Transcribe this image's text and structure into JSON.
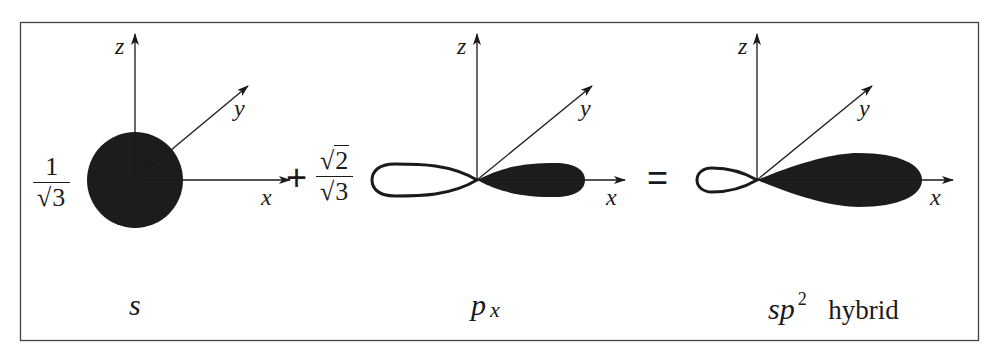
{
  "figure": {
    "colors": {
      "line": "#1a1a1a",
      "fill": "#1c1c1c",
      "frame": "#444444",
      "background": "#ffffff"
    }
  },
  "panels": [
    {
      "id": "s",
      "coefficient": {
        "numerator": "1",
        "denominator_radical": "3",
        "sqrt_symbol": "√"
      },
      "axes": {
        "z": "z",
        "y": "y",
        "x": "x"
      },
      "caption": {
        "main": "s",
        "superscript": "",
        "subscript": "",
        "suffix": ""
      }
    },
    {
      "id": "px",
      "operator_before": "+",
      "coefficient": {
        "numerator_radical": "2",
        "denominator_radical": "3",
        "sqrt_symbol": "√"
      },
      "axes": {
        "z": "z",
        "y": "y",
        "x": "x"
      },
      "caption": {
        "main": "p",
        "subscript": "x"
      }
    },
    {
      "id": "sp2",
      "operator_before": "=",
      "axes": {
        "z": "z",
        "y": "y",
        "x": "x"
      },
      "caption": {
        "main": "sp",
        "superscript": "2",
        "suffix": "hybrid"
      }
    }
  ]
}
